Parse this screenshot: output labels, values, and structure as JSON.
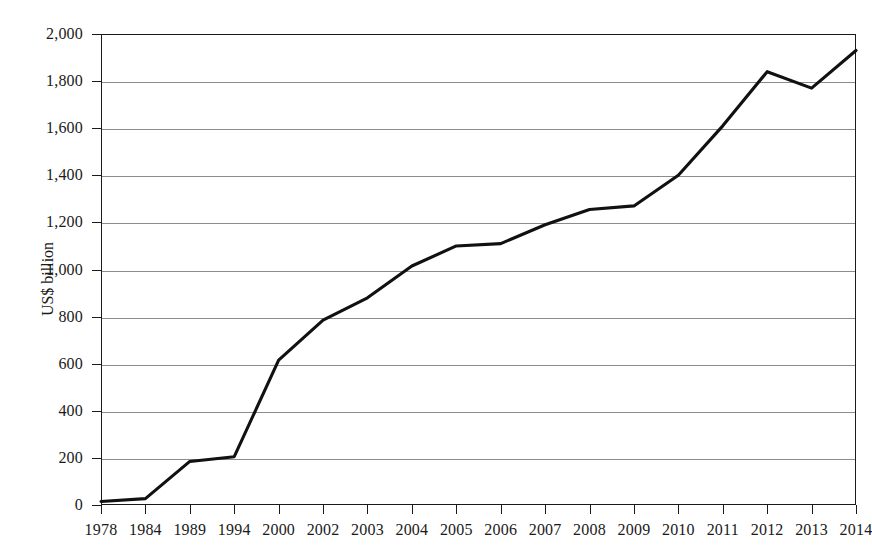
{
  "chart_data": {
    "type": "line",
    "title": "",
    "xlabel": "",
    "ylabel": "US$ billion",
    "categories": [
      "1978",
      "1984",
      "1989",
      "1994",
      "2000",
      "2002",
      "2003",
      "2004",
      "2005",
      "2006",
      "2007",
      "2008",
      "2009",
      "2010",
      "2011",
      "2012",
      "2013",
      "2014"
    ],
    "values": [
      15,
      27,
      185,
      205,
      615,
      785,
      880,
      1015,
      1100,
      1110,
      1190,
      1255,
      1270,
      1400,
      1610,
      1840,
      1770,
      1930
    ],
    "series": [
      {
        "name": "US$ billion",
        "values": [
          15,
          27,
          185,
          205,
          615,
          785,
          880,
          1015,
          1100,
          1110,
          1190,
          1255,
          1270,
          1400,
          1610,
          1840,
          1770,
          1930
        ]
      }
    ],
    "ylim": [
      0,
      2000
    ],
    "yticks": [
      0,
      200,
      400,
      600,
      800,
      1000,
      1200,
      1400,
      1600,
      1800,
      2000
    ],
    "ytick_labels": [
      "0",
      "200",
      "400",
      "600",
      "800",
      "1,000",
      "1,200",
      "1,400",
      "1,600",
      "1,800",
      "2,000"
    ],
    "grid": true,
    "grid_axis": "y",
    "legend": false,
    "legend_position": "none",
    "line_color": "#111111",
    "grid_color": "#8c8c8c",
    "axis_color": "#1a1a1a",
    "background_color": "#ffffff"
  }
}
